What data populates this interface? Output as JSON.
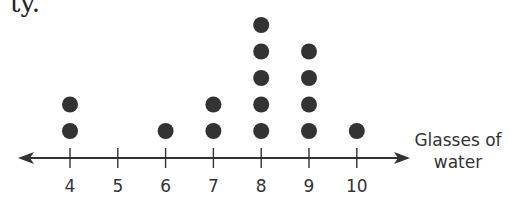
{
  "text_fragment": "ty.",
  "chart_data": {
    "type": "dot_plot",
    "title": "",
    "xlabel": "Glasses of water",
    "xlabel_lines": [
      "Glasses of",
      "water"
    ],
    "ylabel": "",
    "categories": [
      4,
      5,
      6,
      7,
      8,
      9,
      10
    ],
    "values": [
      2,
      0,
      1,
      2,
      5,
      4,
      1
    ],
    "xlim": [
      4,
      10
    ],
    "grid": false,
    "legend": null,
    "dot_color": "#333333",
    "axis_color": "#333333"
  }
}
